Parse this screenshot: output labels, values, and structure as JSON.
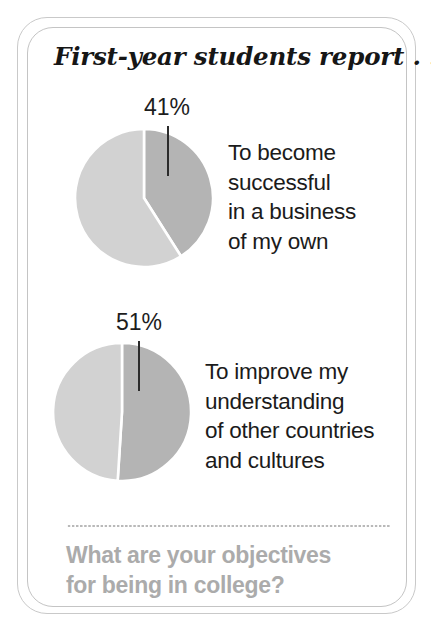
{
  "header": {
    "title": "First-year students report . . ."
  },
  "colors": {
    "slice_dark": "#b4b4b4",
    "slice_light": "#d2d2d2",
    "slice_gap": "#ffffff",
    "frame": "#c6c6c6",
    "text": "#1b1b1b",
    "footer_text": "#ababab",
    "divider": "#b9b9b9",
    "background": "#ffffff"
  },
  "chart_data": [
    {
      "type": "pie",
      "title": "To become successful in a business of my own",
      "label": "41%",
      "labels": [
        "Agree",
        "Other"
      ],
      "values": [
        41,
        59
      ],
      "slice_colors": [
        "#b4b4b4",
        "#d2d2d2"
      ],
      "start_angle_deg": 0,
      "direction": "clockwise",
      "annotations": [
        "41%"
      ],
      "legend": "none",
      "grid": false,
      "caption_lines": [
        "To become",
        "successful",
        "in a business",
        "of my own"
      ]
    },
    {
      "type": "pie",
      "title": "To improve my understanding of other countries and cultures",
      "label": "51%",
      "labels": [
        "Agree",
        "Other"
      ],
      "values": [
        51,
        49
      ],
      "slice_colors": [
        "#b4b4b4",
        "#d2d2d2"
      ],
      "start_angle_deg": 0,
      "direction": "clockwise",
      "annotations": [
        "51%"
      ],
      "legend": "none",
      "grid": false,
      "caption_lines": [
        "To improve my",
        "understanding",
        "of other countries",
        "and cultures"
      ]
    }
  ],
  "footer": {
    "question_lines": [
      "What are your objectives",
      "for being in college?"
    ]
  }
}
